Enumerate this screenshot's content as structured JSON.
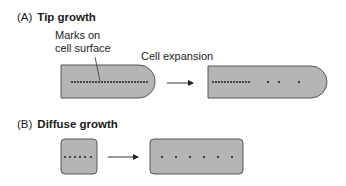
{
  "panel_a": {
    "letter": "(A)",
    "title": "Tip growth",
    "annotation_line1": "Marks on",
    "annotation_line2": "cell surface",
    "arrow_label": "Cell expansion"
  },
  "panel_b": {
    "letter": "(B)",
    "title": "Diffuse growth"
  },
  "colors": {
    "cell_fill": "#b5b5b5",
    "cell_stroke": "#555555",
    "mark": "#111111",
    "arrow": "#333333"
  }
}
